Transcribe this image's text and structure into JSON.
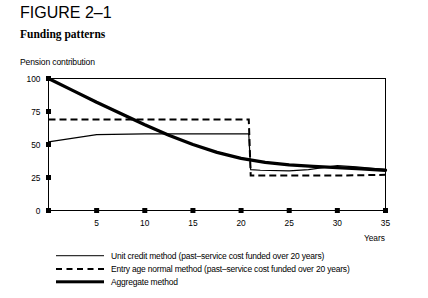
{
  "figure": {
    "number": "FIGURE 2–1",
    "title": "Funding patterns"
  },
  "chart_data": {
    "type": "line",
    "title": "Funding patterns",
    "xlabel": "Years",
    "ylabel": "Pension contribution",
    "xlim": [
      0,
      35
    ],
    "ylim": [
      0,
      100
    ],
    "xticks": [
      0,
      5,
      10,
      15,
      20,
      25,
      30,
      35
    ],
    "xticklabels": [
      "",
      "5",
      "10",
      "15",
      "20",
      "25",
      "30",
      "35"
    ],
    "yticks": [
      0,
      25,
      50,
      75,
      100
    ],
    "yticklabels": [
      "0",
      "25",
      "50",
      "75",
      "100"
    ],
    "grid": false,
    "legend_position": "below",
    "series": [
      {
        "name": "unit_credit",
        "label": "Unit credit method (past–service cost funded over 20 years)",
        "style": "solid-thin",
        "x": [
          0,
          5,
          10,
          15,
          20,
          20.8,
          21,
          22,
          25,
          27,
          30,
          32,
          35
        ],
        "y": [
          52,
          57.5,
          58,
          58,
          58,
          58,
          31,
          30.5,
          30,
          31,
          34,
          33,
          31
        ]
      },
      {
        "name": "entry_age_normal",
        "label": "Entry age normal method (past–service cost funded over 20 years)",
        "style": "dashed",
        "x": [
          0,
          5,
          10,
          15,
          20,
          20.8,
          21,
          25,
          30,
          35
        ],
        "y": [
          69,
          69,
          69,
          69,
          69,
          69,
          26.5,
          26.5,
          26.5,
          27
        ]
      },
      {
        "name": "aggregate",
        "label": "Aggregate method",
        "style": "solid-thick",
        "x": [
          0,
          2.5,
          5,
          7.5,
          10,
          12.5,
          15,
          17.5,
          20,
          22.5,
          25,
          27.5,
          30,
          32.5,
          35
        ],
        "y": [
          100,
          91,
          82,
          73.5,
          65,
          57,
          50,
          44,
          39.5,
          36.5,
          34.5,
          33.5,
          32.5,
          31.5,
          30.5
        ]
      }
    ]
  },
  "legend": {
    "items": [
      {
        "label": "Unit credit method (past–service cost funded over 20 years)",
        "style": "solid-thin"
      },
      {
        "label": "Entry age normal method (past–service cost funded over 20 years)",
        "style": "dashed"
      },
      {
        "label": "Aggregate method",
        "style": "solid-thick"
      }
    ]
  }
}
